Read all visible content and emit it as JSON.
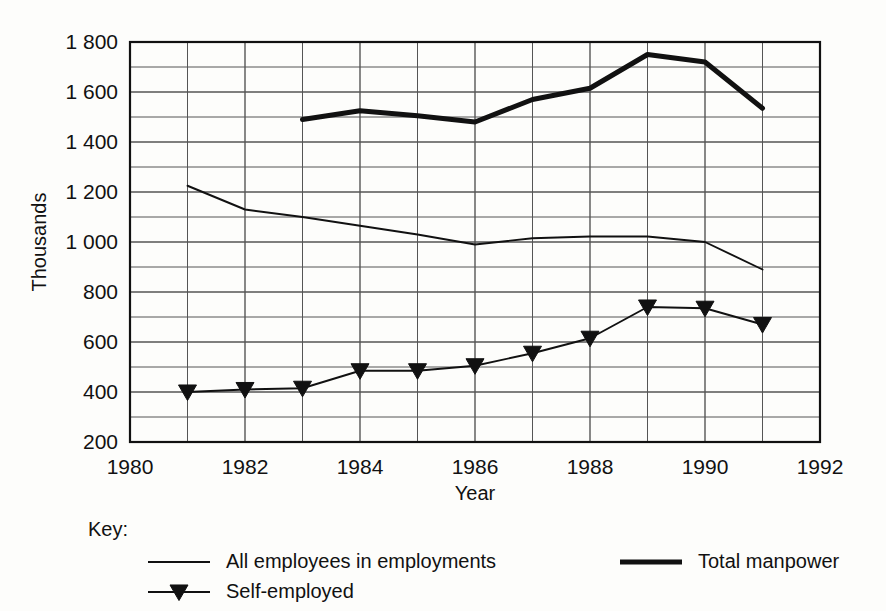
{
  "chart_data": {
    "type": "line",
    "title": "",
    "xlabel": "Year",
    "ylabel": "Thousands",
    "xlim": [
      1980,
      1992
    ],
    "ylim": [
      200,
      1800
    ],
    "x_ticks": [
      1980,
      1982,
      1984,
      1986,
      1988,
      1990,
      1992
    ],
    "x_tick_labels": [
      "1980",
      "1982",
      "1984",
      "1986",
      "1988",
      "1990",
      "1992"
    ],
    "x_minor_step": 1,
    "y_ticks": [
      200,
      400,
      600,
      800,
      1000,
      1200,
      1400,
      1600,
      1800
    ],
    "y_tick_labels": [
      "200",
      "400",
      "600",
      "800",
      "1 000",
      "1 200",
      "1 400",
      "1 600",
      "1 800"
    ],
    "y_minor_step": 100,
    "grid": true,
    "legend_position": "below-plot",
    "legend_title": "Key:",
    "series": [
      {
        "name": "All employees in employments",
        "style": "thin-line",
        "marker": "none",
        "color": "#111111",
        "x": [
          1981,
          1982,
          1983,
          1984,
          1985,
          1986,
          1987,
          1988,
          1989,
          1990,
          1991
        ],
        "values": [
          1225,
          1130,
          1100,
          1065,
          1030,
          990,
          1015,
          1022,
          1022,
          1000,
          890
        ]
      },
      {
        "name": "Total manpower",
        "style": "thick-line",
        "marker": "none",
        "color": "#111111",
        "x": [
          1983,
          1984,
          1985,
          1986,
          1987,
          1988,
          1989,
          1990,
          1991
        ],
        "values": [
          1490,
          1525,
          1505,
          1480,
          1570,
          1615,
          1750,
          1720,
          1535
        ]
      },
      {
        "name": "Self-employed",
        "style": "thin-line",
        "marker": "triangle-down",
        "color": "#111111",
        "x": [
          1981,
          1982,
          1983,
          1984,
          1985,
          1986,
          1987,
          1988,
          1989,
          1990,
          1991
        ],
        "values": [
          400,
          410,
          415,
          485,
          485,
          505,
          555,
          615,
          740,
          735,
          670
        ]
      }
    ]
  },
  "legend": {
    "key_label": "Key:",
    "entries": [
      {
        "label": "All employees in employments",
        "style": "thin-line",
        "marker": "none"
      },
      {
        "label": "Total manpower",
        "style": "thick-line",
        "marker": "none"
      },
      {
        "label": "Self-employed",
        "style": "thin-line",
        "marker": "triangle-down"
      }
    ]
  },
  "colors": {
    "ink": "#111111",
    "grid": "#555555",
    "frame": "#111111",
    "background": "#fdfdfb"
  }
}
